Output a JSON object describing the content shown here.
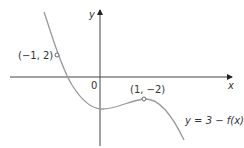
{
  "axes": {
    "x_label": "x",
    "y_label": "y",
    "origin_label": "0"
  },
  "points": [
    {
      "label": "(−1, 2)",
      "x": -1,
      "y": 2
    },
    {
      "label": "(1, −2)",
      "x": 1,
      "y": -2
    }
  ],
  "curve": {
    "label": "y = 3 − f(x)",
    "color": "#999999"
  }
}
